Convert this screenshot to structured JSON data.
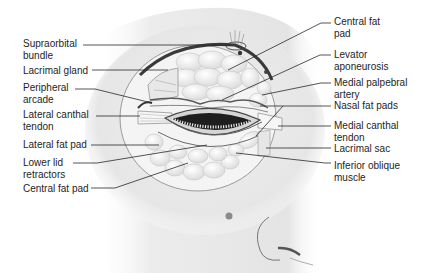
{
  "diagram": {
    "labels_left": [
      {
        "id": "supraorbital-bundle",
        "text": "Supraorbital\nbundle",
        "x": 23,
        "y": 38
      },
      {
        "id": "lacrimal-gland",
        "text": "Lacrimal gland",
        "x": 23,
        "y": 65
      },
      {
        "id": "peripheral-arcade",
        "text": "Peripheral\narcade",
        "x": 23,
        "y": 82
      },
      {
        "id": "lateral-canthal-tendon",
        "text": "Lateral canthal\ntendon",
        "x": 23,
        "y": 109
      },
      {
        "id": "lateral-fat-pad",
        "text": "Lateral fat pad",
        "x": 23,
        "y": 139
      },
      {
        "id": "lower-lid-retractors",
        "text": "Lower lid\nretractors",
        "x": 23,
        "y": 157
      },
      {
        "id": "central-fat-pad-lower",
        "text": "Central fat pad",
        "x": 23,
        "y": 183
      }
    ],
    "labels_right": [
      {
        "id": "central-fat-pad-upper",
        "text": "Central fat\npad",
        "x": 334,
        "y": 16
      },
      {
        "id": "levator-aponeurosis",
        "text": "Levator\naponeurosis",
        "x": 334,
        "y": 49
      },
      {
        "id": "medial-palpebral-artery",
        "text": "Medial palpebral\nartery",
        "x": 334,
        "y": 77
      },
      {
        "id": "nasal-fat-pads",
        "text": "Nasal fat pads",
        "x": 334,
        "y": 100
      },
      {
        "id": "medial-canthal-tendon",
        "text": "Medial canthal\ntendon",
        "x": 334,
        "y": 120
      },
      {
        "id": "lacrimal-sac",
        "text": "Lacrimal sac",
        "x": 334,
        "y": 143
      },
      {
        "id": "inferior-oblique-muscle",
        "text": "Inferior oblique\nmuscle",
        "x": 334,
        "y": 160
      }
    ],
    "leader_lines": [
      {
        "label": "supraorbital-bundle",
        "points": "83,45 230,45"
      },
      {
        "label": "lacrimal-gland",
        "points": "92,70 168,70"
      },
      {
        "label": "peripheral-arcade",
        "points": "75,89 95,89 152,103"
      },
      {
        "label": "lateral-canthal-tendon",
        "points": "96,116 140,116"
      },
      {
        "label": "lateral-fat-pad",
        "points": "91,145 159,145"
      },
      {
        "label": "lower-lid-retractors",
        "points": "73,163 97,163 207,145"
      },
      {
        "label": "central-fat-pad-lower",
        "points": "91,188 115,188 188,163"
      },
      {
        "label": "central-fat-pad-upper",
        "points": "331,23 321,23 228,70"
      },
      {
        "label": "levator-aponeurosis",
        "points": "331,55 320,55 222,100"
      },
      {
        "label": "medial-palpebral-artery",
        "points": "331,83 321,83 262,95"
      },
      {
        "label": "nasal-fat-pads",
        "points": "331,106 260,106"
      },
      {
        "label": "medial-canthal-tendon",
        "points": "331,126 278,126"
      },
      {
        "label": "lacrimal-sac",
        "points": "331,148 266,148"
      },
      {
        "label": "inferior-oblique-muscle",
        "points": "331,163 325,163 236,153"
      },
      {
        "label": "nasal-fat-pads-secondary",
        "points": "283,106 256,136"
      }
    ]
  }
}
